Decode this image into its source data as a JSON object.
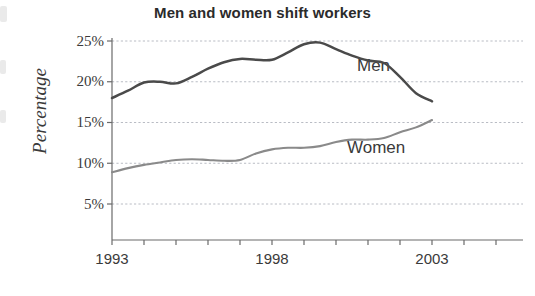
{
  "chart_data": {
    "type": "line",
    "title": "Men and women shift workers",
    "xlabel": "",
    "ylabel": "Percentage",
    "xlim": [
      1993,
      2003
    ],
    "ylim": [
      0,
      26
    ],
    "grid": true,
    "legend_position": "inline-annotations",
    "x_tick_labels": [
      "1993",
      "1998",
      "2003"
    ],
    "x_tick_values": [
      1993,
      1998,
      2003
    ],
    "x_minor_ticks": [
      1994,
      1995,
      1996,
      1997,
      1999,
      2000,
      2001,
      2002
    ],
    "y_tick_labels": [
      "25%",
      "20%",
      "15%",
      "10%",
      "5%"
    ],
    "y_tick_values": [
      25,
      20,
      15,
      10,
      5
    ],
    "x": [
      1993,
      1993.5,
      1994,
      1994.5,
      1995,
      1995.5,
      1996,
      1996.5,
      1997,
      1997.5,
      1998,
      1998.5,
      1999,
      1999.5,
      2000,
      2000.5,
      2001,
      2001.5,
      2002,
      2002.5,
      2003
    ],
    "series": [
      {
        "name": "Men",
        "color": "#4a4a4a",
        "annotation": "Men",
        "values": [
          18.0,
          18.9,
          19.9,
          20.0,
          19.8,
          20.6,
          21.6,
          22.4,
          22.8,
          22.7,
          22.7,
          23.6,
          24.6,
          24.8,
          24.0,
          23.2,
          22.6,
          22.3,
          20.6,
          18.6,
          17.6
        ]
      },
      {
        "name": "Women",
        "color": "#8a8a8a",
        "annotation": "Women",
        "values": [
          8.9,
          9.4,
          9.8,
          10.1,
          10.4,
          10.5,
          10.4,
          10.3,
          10.4,
          11.2,
          11.7,
          11.9,
          11.9,
          12.1,
          12.6,
          12.9,
          12.9,
          13.1,
          13.8,
          14.4,
          15.3
        ]
      }
    ]
  },
  "labels": {
    "title": "Men and women shift workers",
    "y_axis_title": "Percentage",
    "men": "Men",
    "women": "Women",
    "ytick_25": "25%",
    "ytick_20": "20%",
    "ytick_15": "15%",
    "ytick_10": "10%",
    "ytick_5": "5%",
    "xtick_1993": "1993",
    "xtick_1998": "1998",
    "xtick_2003": "2003"
  }
}
